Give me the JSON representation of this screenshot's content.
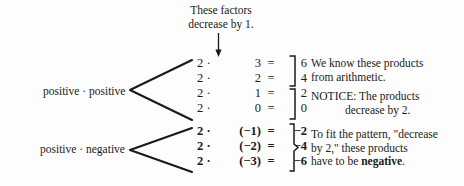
{
  "figure": {
    "top_caption": {
      "line1": "These factors",
      "line2": "decrease by 1."
    },
    "arrow": "down-arrow",
    "group_labels": {
      "positive_positive": "positive · positive",
      "positive_negative": "positive · negative"
    },
    "equations": {
      "positive_group": [
        {
          "left": "2 ·",
          "factor": "3",
          "eq": "=",
          "product": "6"
        },
        {
          "left": "2 ·",
          "factor": "2",
          "eq": "=",
          "product": "4"
        },
        {
          "left": "2 ·",
          "factor": "1",
          "eq": "=",
          "product": "2"
        },
        {
          "left": "2 ·",
          "factor": "0",
          "eq": "=",
          "product": "0"
        }
      ],
      "negative_group": [
        {
          "left": "2 ·",
          "factor": "(−1)",
          "eq": "=",
          "product": "−2"
        },
        {
          "left": "2 ·",
          "factor": "(−2)",
          "eq": "=",
          "product": "−4"
        },
        {
          "left": "2 ·",
          "factor": "(−3)",
          "eq": "=",
          "product": "−6"
        }
      ]
    },
    "notes": {
      "arithmetic": {
        "line1": "We know these products",
        "line2": "from arithmetic."
      },
      "notice": {
        "line1": "NOTICE: The products",
        "line2": "decrease by 2."
      },
      "fit_pattern": {
        "line1": "To fit the pattern, \"decrease",
        "line2": "by 2,\" these products",
        "line3_prefix": "have to be ",
        "line3_bold": "negative",
        "line3_suffix": "."
      }
    },
    "colors": {
      "ink": "#1a1a1a",
      "background": "#fdfdfd"
    }
  }
}
